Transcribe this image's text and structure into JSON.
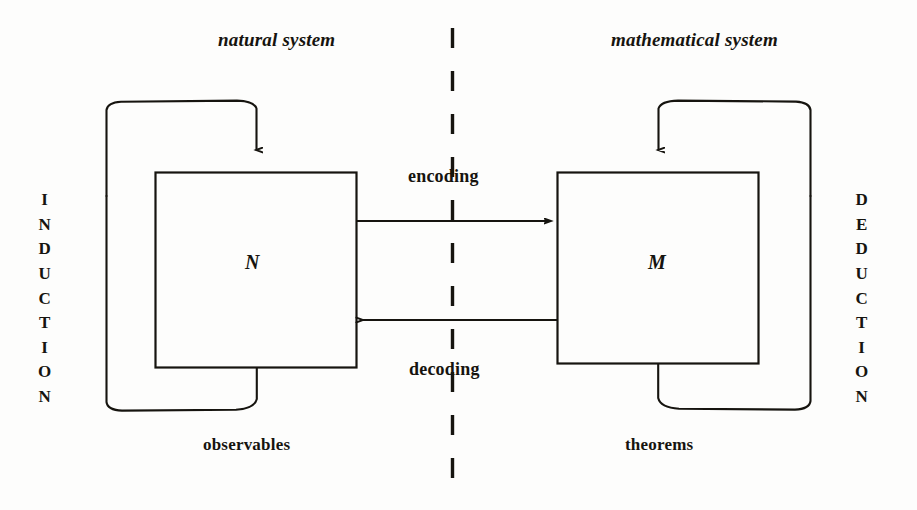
{
  "figure": {
    "type": "modelling-relation-diagram",
    "background_color": "#fdfdfc",
    "ink_color": "#16140f"
  },
  "titles": {
    "left": "natural system",
    "right": "mathematical system"
  },
  "boxes": {
    "left": {
      "letter": "N",
      "caption": "observables",
      "loop_label": "INDUCTION"
    },
    "right": {
      "letter": "M",
      "caption": "theorems",
      "loop_label": "DEDUCTION"
    }
  },
  "arrows": {
    "forward": "encoding",
    "backward": "decoding"
  },
  "vertical_labels": {
    "induction_chars": [
      "I",
      "N",
      "D",
      "U",
      "C",
      "T",
      "I",
      "O",
      "N"
    ],
    "deduction_chars": [
      "D",
      "E",
      "D",
      "U",
      "C",
      "T",
      "I",
      "O",
      "N"
    ]
  },
  "divider": {
    "style": "dashed-vertical"
  }
}
